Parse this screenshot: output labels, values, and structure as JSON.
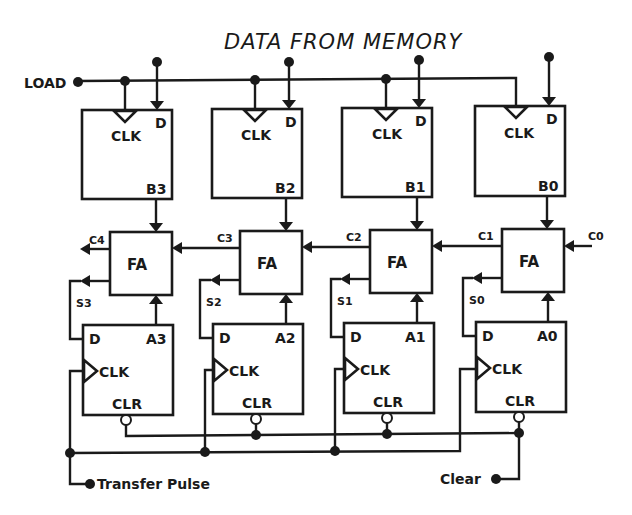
{
  "title": "DATA FROM MEMORY",
  "inputs": {
    "load": "LOAD",
    "transfer_pulse": "Transfer Pulse",
    "clear": "Clear",
    "carry_in": "C0"
  },
  "b_registers": [
    {
      "name": "B3",
      "clk": "CLK",
      "d": "D"
    },
    {
      "name": "B2",
      "clk": "CLK",
      "d": "D"
    },
    {
      "name": "B1",
      "clk": "CLK",
      "d": "D"
    },
    {
      "name": "B0",
      "clk": "CLK",
      "d": "D"
    }
  ],
  "full_adders": [
    {
      "label": "FA",
      "carry_out": "C4",
      "sum": "S3"
    },
    {
      "label": "FA",
      "carry_out": "C3",
      "sum": "S2"
    },
    {
      "label": "FA",
      "carry_out": "C2",
      "sum": "S1"
    },
    {
      "label": "FA",
      "carry_out": "C1",
      "sum": "S0"
    }
  ],
  "a_registers": [
    {
      "name": "A3",
      "d": "D",
      "clk": "CLK",
      "clr": "CLR"
    },
    {
      "name": "A2",
      "d": "D",
      "clk": "CLK",
      "clr": "CLR"
    },
    {
      "name": "A1",
      "d": "D",
      "clk": "CLK",
      "clr": "CLR"
    },
    {
      "name": "A0",
      "d": "D",
      "clk": "CLK",
      "clr": "CLR"
    }
  ]
}
